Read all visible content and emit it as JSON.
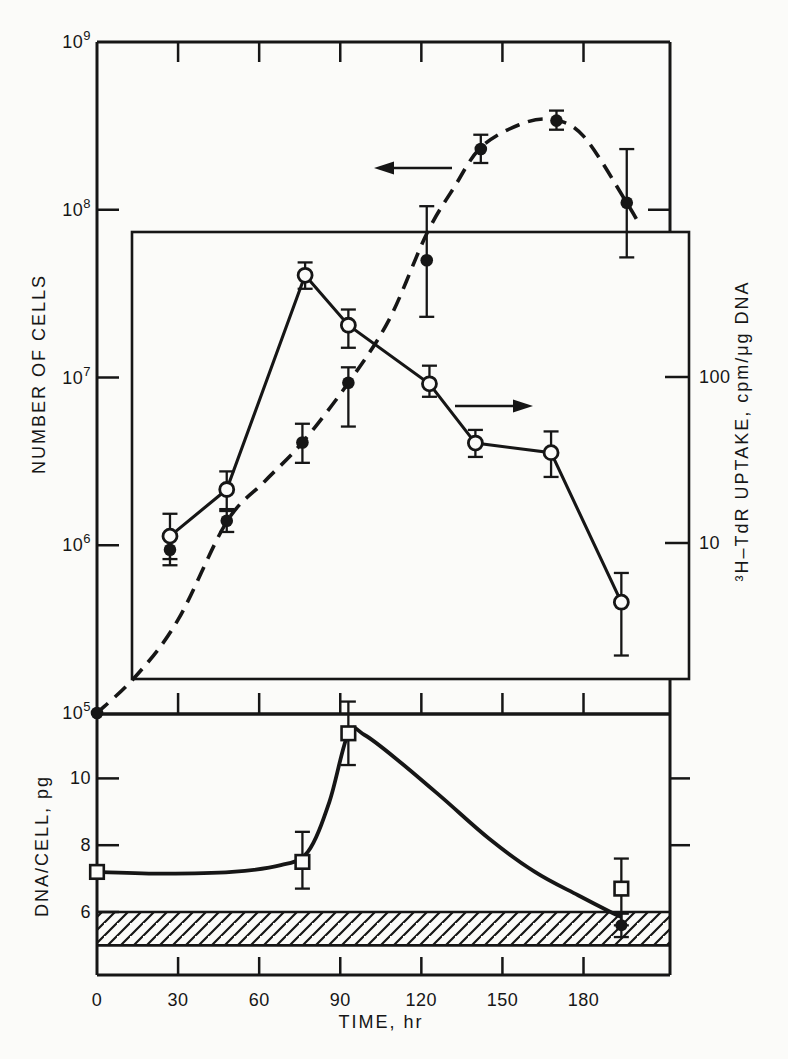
{
  "figure": {
    "background": "#fbfbf9",
    "ink": "#161616"
  },
  "axes": {
    "left_main": {
      "title": "NUMBER OF CELLS",
      "scale": "log",
      "range": [
        100000.0,
        1000000000.0
      ],
      "tick_labels": [
        "10⁹",
        "10⁸",
        "10⁷",
        "10⁶",
        "10⁵"
      ],
      "tick_values": [
        1000000000.0,
        100000000.0,
        10000000.0,
        1000000.0,
        100000.0
      ]
    },
    "right_inset": {
      "title": "³H–TdR UPTAKE, cpm/μg DNA",
      "scale": "log",
      "tick_labels": [
        "100",
        "10"
      ],
      "tick_values": [
        100,
        10
      ]
    },
    "left_bottom": {
      "title": "DNA/CELL, pg",
      "scale": "linear",
      "range": [
        4.1,
        11.9
      ],
      "tick_labels": [
        "10",
        "8",
        "6"
      ],
      "tick_values": [
        10,
        8,
        6
      ]
    },
    "x": {
      "title": "TIME, hr",
      "scale": "linear",
      "range": [
        0,
        212
      ],
      "tick_labels": [
        "0",
        "30",
        "60",
        "90",
        "120",
        "150",
        "180"
      ],
      "tick_values": [
        0,
        30,
        60,
        90,
        120,
        150,
        180
      ]
    }
  },
  "chart_data": {
    "type": "line",
    "x_unit": "hr",
    "series": [
      {
        "name": "number-of-cells",
        "axis": "left_main",
        "marker": "filled-circle",
        "line": "dashed",
        "points": [
          {
            "t": 0,
            "v": 100000.0
          },
          {
            "t": 27,
            "v": 940000.0,
            "lo": 760000.0,
            "hi": 1150000.0
          },
          {
            "t": 48,
            "v": 1400000.0,
            "lo": 1200000.0,
            "hi": 1600000.0
          },
          {
            "t": 76,
            "v": 4100000.0,
            "lo": 3100000.0,
            "hi": 5300000.0
          },
          {
            "t": 93,
            "v": 9300000.0,
            "lo": 5100000.0,
            "hi": 11500000.0
          },
          {
            "t": 122,
            "v": 50000000.0,
            "lo": 23000000.0,
            "hi": 105000000.0
          },
          {
            "t": 142,
            "v": 230000000.0,
            "lo": 190000000.0,
            "hi": 280000000.0
          },
          {
            "t": 170,
            "v": 340000000.0,
            "lo": 300000000.0,
            "hi": 390000000.0
          },
          {
            "t": 196,
            "v": 110000000.0,
            "lo": 52000000.0,
            "hi": 230000000.0
          }
        ],
        "fit_curve": [
          [
            0,
            100000.0
          ],
          [
            15,
            170000.0
          ],
          [
            30,
            360000.0
          ],
          [
            48,
            1380000.0
          ],
          [
            62,
            2400000.0
          ],
          [
            76,
            4100000.0
          ],
          [
            93,
            9300000.0
          ],
          [
            108,
            22000000.0
          ],
          [
            122,
            72000000.0
          ],
          [
            132,
            135000000.0
          ],
          [
            142,
            235000000.0
          ],
          [
            156,
            320000000.0
          ],
          [
            168,
            345000000.0
          ],
          [
            180,
            275000000.0
          ],
          [
            196,
            110000000.0
          ],
          [
            201,
            80000000.0
          ]
        ]
      },
      {
        "name": "h3-tdr-uptake",
        "axis": "right_inset",
        "marker": "open-circle",
        "line": "solid",
        "points": [
          {
            "t": 27,
            "v": 11,
            "lo": 8,
            "hi": 15
          },
          {
            "t": 48,
            "v": 21,
            "lo": 16,
            "hi": 27
          },
          {
            "t": 77,
            "v": 410,
            "lo": 340,
            "hi": 490
          },
          {
            "t": 93,
            "v": 205,
            "lo": 150,
            "hi": 255
          },
          {
            "t": 123,
            "v": 91,
            "lo": 76,
            "hi": 117
          },
          {
            "t": 140,
            "v": 40,
            "lo": 33,
            "hi": 48
          },
          {
            "t": 168,
            "v": 35,
            "lo": 25,
            "hi": 47
          },
          {
            "t": 194,
            "v": 4.4,
            "lo": 2.1,
            "hi": 6.6
          }
        ]
      },
      {
        "name": "dna-per-cell",
        "axis": "left_bottom",
        "marker": "open-square",
        "line": "smooth",
        "points": [
          {
            "t": 0,
            "v": 7.2
          },
          {
            "t": 76,
            "v": 7.5,
            "lo": 6.7,
            "hi": 8.4
          },
          {
            "t": 93,
            "v": 11.35,
            "lo": 10.4,
            "hi": 12.3
          },
          {
            "t": 194,
            "v": 6.7,
            "lo": 5.6,
            "hi": 7.6
          }
        ],
        "fit_curve": [
          [
            0,
            7.2
          ],
          [
            25,
            7.15
          ],
          [
            50,
            7.2
          ],
          [
            68,
            7.4
          ],
          [
            78,
            7.8
          ],
          [
            86,
            9.3
          ],
          [
            93,
            11.35
          ],
          [
            99,
            11.3
          ],
          [
            112,
            10.5
          ],
          [
            128,
            9.4
          ],
          [
            145,
            8.2
          ],
          [
            162,
            7.2
          ],
          [
            178,
            6.5
          ],
          [
            190,
            6.0
          ],
          [
            194,
            5.85
          ]
        ],
        "extra_point": {
          "t": 194,
          "v": 5.6,
          "lo": 5.25,
          "hi": 5.95,
          "marker": "filled-circle"
        }
      }
    ],
    "hatched_band": {
      "axis": "left_bottom",
      "from": 5,
      "to": 6,
      "style": "diagonal-hatch"
    },
    "annotations": {
      "left_arrow": {
        "meaning": "cell curve reads on left axis",
        "direction": "left"
      },
      "right_arrow": {
        "meaning": "uptake curve reads on right axis",
        "direction": "right"
      }
    },
    "legend_position": "none",
    "grid": false
  }
}
